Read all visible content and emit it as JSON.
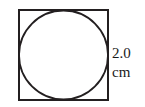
{
  "figure": {
    "background_color": "#ffffff",
    "stroke_color": "#231f20",
    "square": {
      "name": "square",
      "x": 19,
      "y": 10,
      "width": 89,
      "height": 90,
      "stroke_width": 2,
      "fill": "none"
    },
    "circle": {
      "name": "inscribed-circle",
      "cx": 63.5,
      "cy": 55,
      "r": 44.5,
      "stroke_width": 1.8,
      "fill": "none"
    }
  },
  "dimension_label": {
    "value": "2.0",
    "unit": "cm",
    "full_text": "2.0 cm",
    "describes": "square-side-length",
    "position": "right-of-square"
  }
}
